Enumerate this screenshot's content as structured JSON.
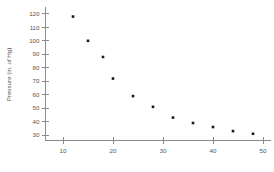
{
  "chart_data": {
    "type": "scatter",
    "title": "",
    "subtitle": "",
    "xlabel": "",
    "ylabel": "Pressure (in. of Hg)",
    "xlim": [
      6.5,
      51.5
    ],
    "ylim": [
      26,
      124
    ],
    "xticks": [
      10,
      20,
      30,
      40,
      50
    ],
    "yticks": [
      30,
      40,
      50,
      60,
      70,
      80,
      90,
      100,
      110,
      120
    ],
    "xtick_labels": [
      "10",
      "20",
      "30",
      "40",
      "50"
    ],
    "ytick_labels": [
      "30",
      "40",
      "50",
      "60",
      "70",
      "80",
      "90",
      "100",
      "110",
      "120"
    ],
    "grid": false,
    "legend": null,
    "legend_position": "none",
    "marker": "square",
    "marker_color": "#1a1a1a",
    "axis_color": "#8c8c8c",
    "tick_label_color": "#555555",
    "background_color": "#ffffff",
    "annotations": [],
    "x": [
      12,
      15,
      18,
      20,
      24,
      28,
      32,
      36,
      40,
      44,
      48
    ],
    "y": [
      118,
      100,
      88,
      72,
      59,
      51,
      43,
      39,
      36,
      33,
      31
    ],
    "points": [
      {
        "x": 12,
        "y": 118
      },
      {
        "x": 15,
        "y": 100
      },
      {
        "x": 18,
        "y": 88
      },
      {
        "x": 20,
        "y": 72
      },
      {
        "x": 24,
        "y": 59
      },
      {
        "x": 28,
        "y": 51
      },
      {
        "x": 32,
        "y": 43
      },
      {
        "x": 36,
        "y": 39
      },
      {
        "x": 40,
        "y": 36
      },
      {
        "x": 44,
        "y": 33
      },
      {
        "x": 48,
        "y": 31
      }
    ]
  }
}
